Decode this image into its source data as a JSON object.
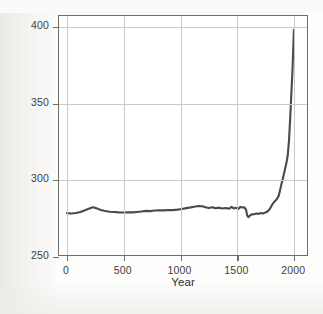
{
  "figure": {
    "background_color": "#fdfdfc",
    "frame_color": "#6d6d6d",
    "grid_color": "#c9c9c9",
    "series_color": "#4a4a4a",
    "caption_bleed": "",
    "y_axis_title_main": "Carbon dioxide (CO",
    "y_axis_title_sub": "2",
    "y_axis_title_tail": ") (ppm)",
    "x_axis_title": "Year"
  },
  "chart_data": {
    "type": "line",
    "title": "",
    "subtitle": "",
    "xlabel": "Year",
    "ylabel": "Carbon dioxide (CO2) (ppm)",
    "xlim": [
      -70,
      2130
    ],
    "ylim": [
      250,
      407
    ],
    "xticks": [
      0,
      500,
      1000,
      1500,
      2000
    ],
    "xtick_labels": [
      "0",
      "500",
      "1000",
      "1500",
      "2000"
    ],
    "yticks": [
      250,
      300,
      350,
      400
    ],
    "ytick_labels": [
      "250",
      "300",
      "350",
      "400"
    ],
    "grid": true,
    "grid_axes": "both",
    "legend": false,
    "legend_position": "none",
    "series": [
      {
        "name": "Atmospheric CO2 concentration",
        "color": "#4a4a4a",
        "line_width": 2.1,
        "x": [
          0,
          40,
          80,
          120,
          160,
          200,
          230,
          260,
          300,
          340,
          380,
          420,
          460,
          500,
          540,
          580,
          620,
          660,
          700,
          740,
          780,
          820,
          860,
          900,
          940,
          980,
          1020,
          1060,
          1100,
          1140,
          1170,
          1200,
          1230,
          1260,
          1290,
          1320,
          1350,
          1380,
          1410,
          1440,
          1460,
          1480,
          1500,
          1520,
          1540,
          1560,
          1575,
          1590,
          1600,
          1610,
          1625,
          1640,
          1660,
          1680,
          1700,
          1720,
          1740,
          1760,
          1780,
          1800,
          1820,
          1840,
          1860,
          1880,
          1900,
          1920,
          1940,
          1950,
          1960,
          1970,
          1980,
          1990,
          2000,
          2010,
          2014
        ],
        "y": [
          277.5,
          277.3,
          277.6,
          278.2,
          279.4,
          280.6,
          281.4,
          280.8,
          279.6,
          278.9,
          278.4,
          278.2,
          278.0,
          277.9,
          278.1,
          278.0,
          278.3,
          278.6,
          279.0,
          278.8,
          279.2,
          279.4,
          279.3,
          279.6,
          279.5,
          279.8,
          280.2,
          280.8,
          281.3,
          281.9,
          282.2,
          282.0,
          281.4,
          280.9,
          281.4,
          280.7,
          281.1,
          280.6,
          280.9,
          280.4,
          281.6,
          280.6,
          281.0,
          280.3,
          281.6,
          281.2,
          281.4,
          279.5,
          275.8,
          274.8,
          276.0,
          276.7,
          276.8,
          277.3,
          277.0,
          277.6,
          277.3,
          277.9,
          278.6,
          280.2,
          283.0,
          285.0,
          286.5,
          289.0,
          295.5,
          301.5,
          308.0,
          311.5,
          316.0,
          325.0,
          338.5,
          354.0,
          369.5,
          389.0,
          398.0
        ]
      }
    ],
    "annotations": []
  }
}
